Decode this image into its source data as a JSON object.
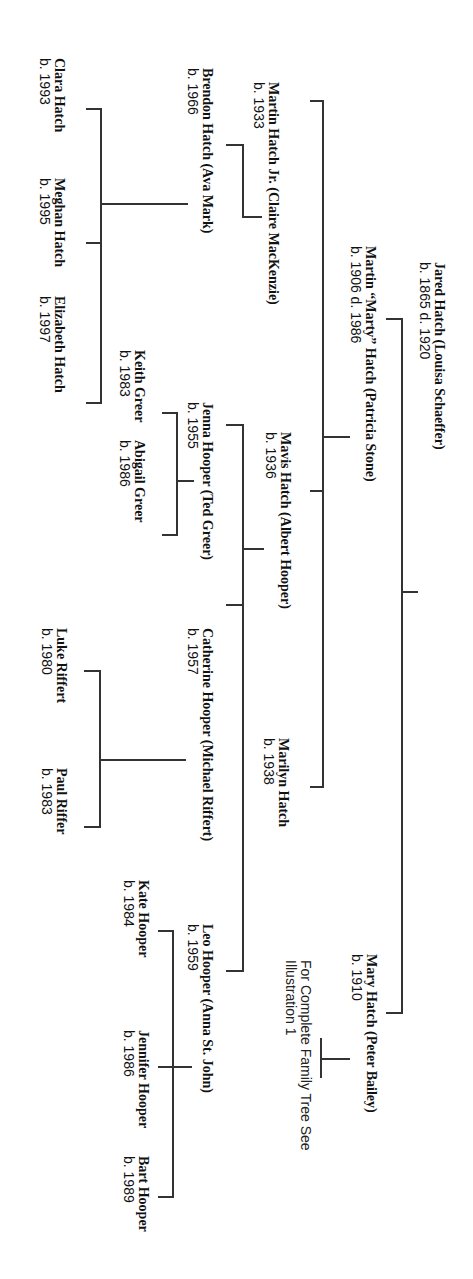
{
  "diagram": {
    "type": "family-tree",
    "orientation": "rotated-90-clockwise",
    "line_color": "#333333",
    "text_color": "#111111",
    "background": "#ffffff"
  },
  "generation_1": {
    "jared": {
      "name": "Jared Hatch  (Louisa Schaeffer)",
      "dates": "b. 1865 d. 1920"
    }
  },
  "generation_2": {
    "martin_sr": {
      "name": "Martin “Marty” Hatch (Patricia Stone)",
      "dates": "b. 1906 d. 1986"
    },
    "mary": {
      "name": "Mary Hatch (Peter Bailey)",
      "dates": "b. 1910"
    }
  },
  "note": {
    "line1": "For Complete Family Tree See",
    "line2": "Illustration 1"
  },
  "generation_3": {
    "martin_jr": {
      "name": "Martin Hatch Jr.  (Claire MacKenzie)",
      "dates": "b. 1933"
    },
    "mavis": {
      "name": "Mavis Hatch (Albert Hooper)",
      "dates": "b. 1936"
    },
    "marilyn": {
      "name": "Marilyn Hatch",
      "dates": "b. 1938"
    }
  },
  "generation_4": {
    "brendon": {
      "name": "Brendon Hatch (Ava Mark)",
      "dates": "b. 1966"
    },
    "jenna": {
      "name": "Jenna Hooper (Ted Greer)",
      "dates": "b. 1955"
    },
    "catherine": {
      "name": "Catherine Hooper (Michael Riffert)",
      "dates": "b. 1957"
    },
    "leo": {
      "name": "Leo Hooper (Anna St. John)",
      "dates": "b. 1959"
    }
  },
  "generation_5": {
    "clara": {
      "name": "Clara Hatch",
      "dates": "b. 1993"
    },
    "meghan": {
      "name": "Meghan Hatch",
      "dates": "b. 1995"
    },
    "elizabeth": {
      "name": "Elizabeth Hatch",
      "dates": "b. 1997"
    },
    "keith": {
      "name": "Keith Greer",
      "dates": "b. 1983"
    },
    "abigail": {
      "name": "Abigail Greer",
      "dates": "b. 1986"
    },
    "luke": {
      "name": "Luke Riffert",
      "dates": "b. 1980"
    },
    "paul": {
      "name": "Paul Riffer",
      "dates": "b. 1983"
    },
    "kate": {
      "name": "Kate Hooper",
      "dates": "b. 1984"
    },
    "jennifer": {
      "name": "Jennifer Hooper",
      "dates": "b. 1986"
    },
    "bart": {
      "name": "Bart Hooper",
      "dates": "b. 1989"
    }
  }
}
